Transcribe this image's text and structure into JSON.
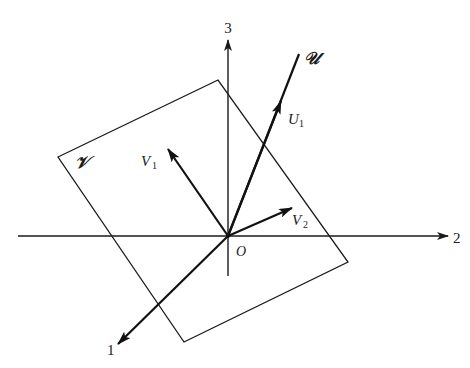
{
  "diagram": {
    "axes": {
      "axis_1_label": "1",
      "axis_2_label": "2",
      "axis_3_label": "3"
    },
    "origin_label": "O",
    "plane": {
      "label": "𝒱"
    },
    "line": {
      "label": "𝒰"
    },
    "vectors": {
      "u1": {
        "label_main": "U",
        "label_sub": "1"
      },
      "v1": {
        "label_main": "V",
        "label_sub": "1"
      },
      "v2": {
        "label_main": "V",
        "label_sub": "2"
      }
    },
    "colors": {
      "ink": "#1a1a1a",
      "background": "#ffffff"
    }
  }
}
